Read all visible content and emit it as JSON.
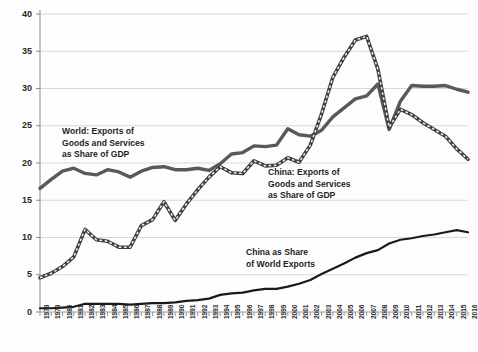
{
  "chart_data": {
    "type": "line",
    "title": "",
    "xlabel": "",
    "ylabel": "",
    "ylim": [
      0,
      40
    ],
    "yticks": [
      0,
      5,
      10,
      15,
      20,
      25,
      30,
      35,
      40
    ],
    "grid": true,
    "legend_position": "inline-annotations",
    "x": [
      1978,
      1979,
      1980,
      1981,
      1982,
      1983,
      1984,
      1985,
      1986,
      1987,
      1988,
      1989,
      1990,
      1991,
      1992,
      1993,
      1994,
      1995,
      1996,
      1997,
      1998,
      1999,
      2000,
      2001,
      2002,
      2003,
      2004,
      2005,
      2006,
      2007,
      2008,
      2009,
      2010,
      2011,
      2012,
      2013,
      2014,
      2015,
      2016
    ],
    "series": [
      {
        "name": "World: Exports of Goods and Services as Share of GDP",
        "style": "solid",
        "color": "#595959",
        "values": [
          16.6,
          17.8,
          18.9,
          19.3,
          18.6,
          18.4,
          19.1,
          18.8,
          18.1,
          18.9,
          19.4,
          19.5,
          19.1,
          19.1,
          19.3,
          19.0,
          19.9,
          21.2,
          21.4,
          22.3,
          22.2,
          22.4,
          24.6,
          23.8,
          23.6,
          24.4,
          26.2,
          27.4,
          28.6,
          29.0,
          30.6,
          24.5,
          28.3,
          30.4,
          30.3,
          30.3,
          30.4,
          29.9,
          29.5
        ]
      },
      {
        "name": "China: Exports of Goods and Services as Share of GDP",
        "style": "dashed",
        "color": "#4a4a4a",
        "values": [
          4.6,
          5.2,
          6.1,
          7.4,
          11.1,
          9.7,
          9.5,
          8.7,
          8.7,
          11.6,
          12.4,
          14.8,
          12.3,
          14.5,
          16.4,
          18.1,
          19.5,
          18.7,
          18.6,
          20.3,
          19.6,
          19.7,
          20.7,
          20.1,
          22.4,
          26.6,
          31.5,
          34.2,
          36.5,
          37.0,
          32.6,
          24.8,
          27.2,
          26.5,
          25.4,
          24.5,
          23.6,
          21.9,
          20.5
        ]
      },
      {
        "name": "China as Share of World Exports",
        "style": "solid-thin",
        "color": "#1a1a1a",
        "values": [
          0.5,
          0.5,
          0.6,
          0.7,
          1.1,
          1.1,
          1.1,
          1.1,
          1.0,
          1.1,
          1.2,
          1.2,
          1.3,
          1.5,
          1.6,
          1.8,
          2.3,
          2.5,
          2.6,
          2.9,
          3.1,
          3.1,
          3.4,
          3.8,
          4.3,
          5.1,
          5.8,
          6.5,
          7.3,
          7.9,
          8.3,
          9.2,
          9.7,
          9.9,
          10.2,
          10.4,
          10.7,
          11.0,
          10.7
        ]
      }
    ],
    "annotations": [
      {
        "id": "world-annotation",
        "lines": [
          "World: Exports of",
          "Goods and Services",
          "as Share of GDP"
        ],
        "x": 62,
        "y": 126
      },
      {
        "id": "china-gdp-annotation",
        "lines": [
          "China: Exports of",
          "Goods and Services",
          "as Share of GDP"
        ],
        "x": 268,
        "y": 167
      },
      {
        "id": "china-world-share-annotation",
        "lines": [
          "China as Share",
          "of World Exports"
        ],
        "x": 246,
        "y": 247
      }
    ]
  }
}
